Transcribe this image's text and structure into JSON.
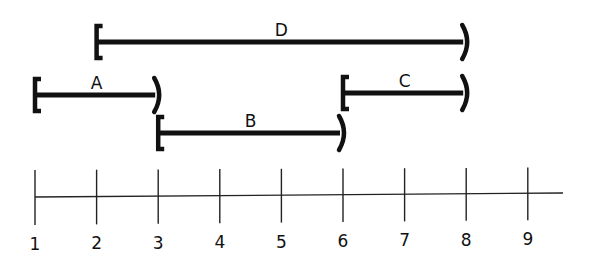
{
  "diagram": {
    "type": "interval-number-line",
    "axis": {
      "ticks": [
        1,
        2,
        3,
        4,
        5,
        6,
        7,
        8,
        9
      ],
      "tick_labels": [
        "1",
        "2",
        "3",
        "4",
        "5",
        "6",
        "7",
        "8",
        "9"
      ]
    },
    "intervals": [
      {
        "label": "D",
        "start": 2,
        "end": 8,
        "start_bracket": "[",
        "end_bracket": ")",
        "start_type": "closed",
        "end_type": "open"
      },
      {
        "label": "A",
        "start": 1,
        "end": 3,
        "start_bracket": "[",
        "end_bracket": ")",
        "start_type": "closed",
        "end_type": "open"
      },
      {
        "label": "C",
        "start": 6,
        "end": 8,
        "start_bracket": "[",
        "end_bracket": ")",
        "start_type": "closed",
        "end_type": "open"
      },
      {
        "label": "B",
        "start": 3,
        "end": 6,
        "start_bracket": "[",
        "end_bracket": ")",
        "start_type": "closed",
        "end_type": "open"
      }
    ],
    "colors": {
      "ink": "#111111",
      "background": "#ffffff"
    }
  }
}
